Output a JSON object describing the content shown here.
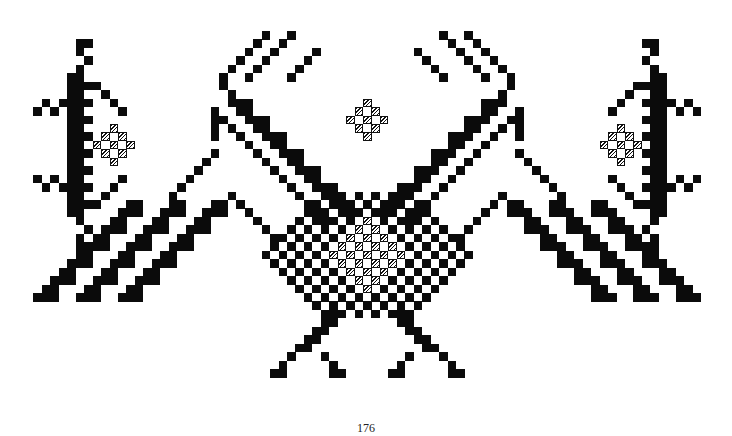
{
  "page": {
    "number": "176"
  },
  "pattern": {
    "title": "",
    "cell_size": 8.45,
    "origin": [
      25,
      31
    ],
    "legend": {
      "#": "filled-stitch",
      "/": "hatched-stitch",
      ".": "empty"
    },
    "colors": {
      "filled": "#0b0b0b",
      "hatched": "#111111",
      "background": "#ffffff"
    },
    "motifs": [
      {
        "name": "left-star",
        "center": [
          8,
          13
        ]
      },
      {
        "name": "double-headed-bird",
        "center": [
          40,
          20
        ]
      },
      {
        "name": "top-center-diamond",
        "center": [
          40,
          9
        ]
      },
      {
        "name": "right-star",
        "center": [
          72,
          13
        ]
      }
    ]
  }
}
